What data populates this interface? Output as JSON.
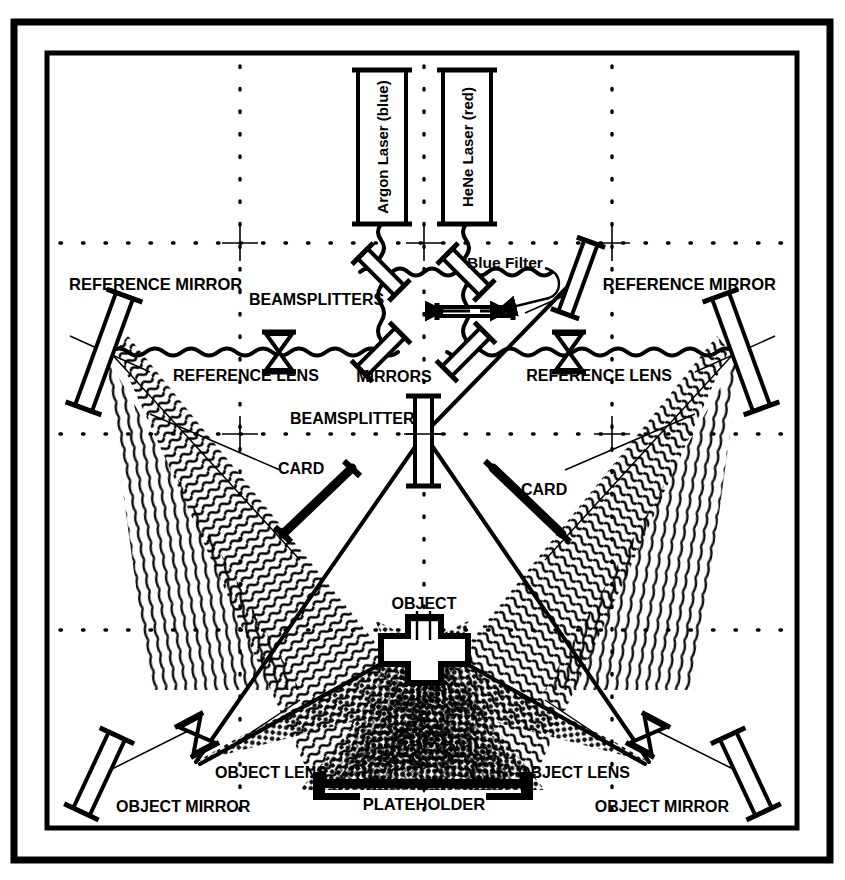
{
  "diagram": {
    "type": "optical-schematic",
    "background_color": "#ffffff",
    "ink_color": "#000000"
  },
  "frame": {
    "outer_border": "#000000",
    "inner_border": "#000000"
  },
  "grid": {
    "style": "dotted",
    "vertical_lines": 3,
    "horizontal_lines": 3,
    "crosshair_markers": 6
  },
  "sources": [
    {
      "id": "argon",
      "label": "Argon Laser (blue)",
      "orientation": "vertical"
    },
    {
      "id": "hene",
      "label": "HeNe Laser (red)",
      "orientation": "vertical"
    }
  ],
  "labels": {
    "blue_filter": "Blue Filter",
    "beamsplitters_plural": "BEAMSPLITTERS",
    "beamsplitter_singular": "BEAMSPLITTER",
    "mirrors": "MIRRORS",
    "reference_mirror_left": "REFERENCE MIRROR",
    "reference_mirror_right": "REFERENCE MIRROR",
    "reference_lens_left": "REFERENCE LENS",
    "reference_lens_right": "REFERENCE LENS",
    "card_left": "CARD",
    "card_right": "CARD",
    "object": "OBJECT",
    "object_lens_left": "OBJECT LENS",
    "object_lens_right": "OBJECT LENS",
    "object_mirror_left": "OBJECT MIRROR",
    "object_mirror_right": "OBJECT MIRROR",
    "plateholder": "PLATEHOLDER"
  },
  "components": {
    "mirrors_count": 4,
    "beamsplitters_count": 3,
    "lenses_count": 4,
    "cards_count": 2,
    "object_shape": "cross",
    "plateholder_shape": "bar-with-end-clamps"
  }
}
